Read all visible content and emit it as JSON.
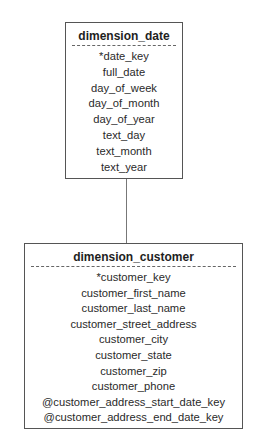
{
  "diagram": {
    "entities": [
      {
        "name": "dimension_date",
        "attributes": [
          "*date_key",
          "full_date",
          "day_of_week",
          "day_of_month",
          "day_of_year",
          "text_day",
          "text_month",
          "text_year"
        ]
      },
      {
        "name": "dimension_customer",
        "attributes": [
          "*customer_key",
          "customer_first_name",
          "customer_last_name",
          "customer_street_address",
          "customer_city",
          "customer_state",
          "customer_zip",
          "customer_phone",
          "@customer_address_start_date_key",
          "@customer_address_end_date_key"
        ]
      }
    ],
    "relationships": [
      {
        "from": "dimension_date",
        "to": "dimension_customer",
        "style": "solid-line"
      }
    ]
  }
}
